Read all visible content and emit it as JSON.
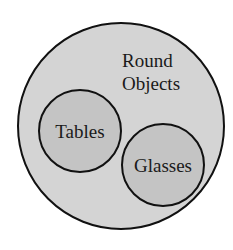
{
  "diagram": {
    "type": "venn-subset",
    "outer": {
      "label_lines": [
        "Round",
        "Objects"
      ],
      "fill": "#d4d4d4"
    },
    "inner": [
      {
        "label": "Tables",
        "fill": "#c4c4c4"
      },
      {
        "label": "Glasses",
        "fill": "#c4c4c4"
      }
    ],
    "stroke": "#111111"
  }
}
